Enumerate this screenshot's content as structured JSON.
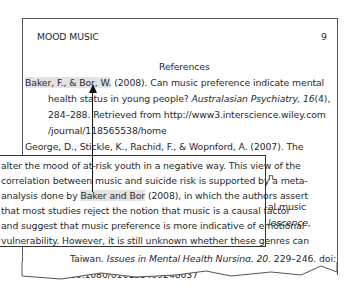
{
  "page": {
    "running_head": "MOOD MUSIC",
    "page_number": "9",
    "section_title": "References"
  },
  "references": {
    "baker_authors": "Baker, F., & Bor, W.",
    "baker_line1_rest": " (2008). Can music preference indicate mental",
    "baker_line2_a": "health status in young people? ",
    "baker_line2_journal": "Australasian Psychiatry, 16",
    "baker_line2_b": "(4),",
    "baker_line3": "284–288. Retrieved from http://www3.interscience.wiley.com",
    "baker_line4": "/journal/118565538/home",
    "george_line1": "George, D., Stickle, K., Rachid, F., & Wopnford, A. (2007). The",
    "hidden_fragment1": "n.",
    "hidden_fragment2": "al music",
    "hidden_fragment3": "lescence,",
    "last_line1_a": "Taiwan. ",
    "last_line1_journal": "Issues in Mental Health Nursing, 20,",
    "last_line1_b": " 229–246. doi:",
    "last_line2": "10.1080/016128499248637"
  },
  "callout": {
    "line1": "alter the mood of at-risk youth in a negative way. This view of the",
    "line2": "correlation between music and suicide risk is supported by a meta-",
    "line3_a": "analysis done by ",
    "line3_cite": "Baker and Bor",
    "line3_b": " (2008), in which the authors assert",
    "line4": "that most studies reject the notion that music is a causal factor",
    "line5": "and suggest that music preference is more indicative of emotional",
    "line6": "vulnerability. However, it is still unknown whether these genres can"
  }
}
